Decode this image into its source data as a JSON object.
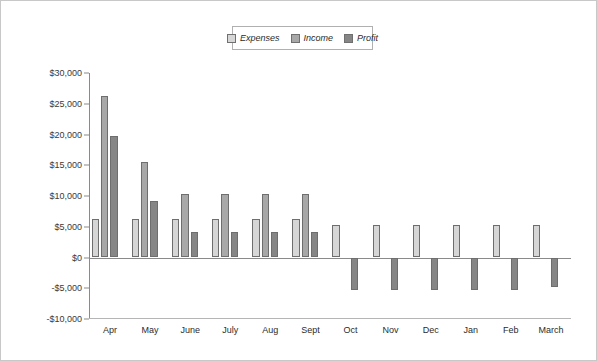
{
  "chart_data": {
    "type": "bar",
    "title": "",
    "subtitle": "",
    "xlabel": "",
    "ylabel": "",
    "grid": false,
    "legend_position": "top-center",
    "ylim": [
      -10000,
      30000
    ],
    "ytick_labels": [
      "$30,000",
      "$25,000",
      "$20,000",
      "$15,000",
      "$10,000",
      "$5,000",
      "$0",
      "-$5,000",
      "-$10,000"
    ],
    "ytick_values": [
      30000,
      25000,
      20000,
      15000,
      10000,
      5000,
      0,
      -5000,
      -10000
    ],
    "categories": [
      "Apr",
      "May",
      "June",
      "July",
      "Aug",
      "Sept",
      "Oct",
      "Nov",
      "Dec",
      "Jan",
      "Feb",
      "March"
    ],
    "series": [
      {
        "name": "Expenses",
        "color": "#d6d6d6",
        "values": [
          6300,
          6300,
          6300,
          6300,
          6300,
          6300,
          5300,
          5300,
          5300,
          5300,
          5300,
          5300
        ]
      },
      {
        "name": "Income",
        "color": "#a8a8a8",
        "values": [
          26200,
          15600,
          10400,
          10400,
          10400,
          10400,
          null,
          null,
          null,
          null,
          null,
          null
        ]
      },
      {
        "name": "Profit",
        "color": "#868686",
        "values": [
          19700,
          9200,
          4200,
          4200,
          4200,
          4200,
          -5300,
          -5300,
          -5300,
          -5300,
          -5300,
          -4800
        ]
      }
    ]
  },
  "legend": {
    "entries": [
      {
        "label": "Expenses",
        "color": "#d6d6d6"
      },
      {
        "label": "Income",
        "color": "#a8a8a8"
      },
      {
        "label": "Profit",
        "color": "#868686"
      }
    ]
  }
}
